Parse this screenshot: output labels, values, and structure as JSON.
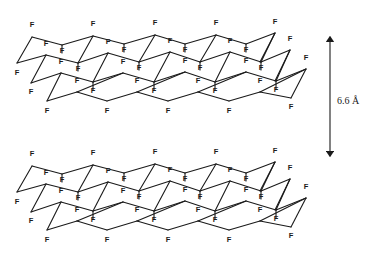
{
  "figure": {
    "atom_label": "F",
    "ink_color": "#1a1a1a",
    "background": "#ffffff"
  },
  "spacing": {
    "label": "6.6 Å",
    "arrow": {
      "x": 330,
      "y_top": 35,
      "y_bottom": 158
    }
  },
  "layers": [
    {
      "name": "top-layer",
      "dy": 0
    },
    {
      "name": "bottom-layer",
      "dy": 129
    }
  ],
  "lattice": {
    "rows": [
      [
        [
          32,
          37
        ],
        [
          62,
          45
        ],
        [
          93,
          36
        ],
        [
          124,
          44
        ],
        [
          155,
          35
        ],
        [
          185,
          44
        ],
        [
          216,
          35
        ],
        [
          246,
          44
        ],
        [
          275,
          33
        ]
      ],
      [
        [
          46,
          55
        ],
        [
          78,
          63
        ],
        [
          108,
          53
        ],
        [
          139,
          62
        ],
        [
          170,
          52
        ],
        [
          200,
          62
        ],
        [
          230,
          52
        ],
        [
          261,
          62
        ],
        [
          290,
          50
        ]
      ],
      [
        [
          61,
          73
        ],
        [
          93,
          82
        ],
        [
          123,
          73
        ],
        [
          154,
          82
        ],
        [
          185,
          72
        ],
        [
          215,
          82
        ],
        [
          246,
          72
        ],
        [
          276,
          81
        ],
        [
          306,
          69
        ]
      ],
      [
        [
          47,
          101
        ],
        [
          77,
          92
        ],
        [
          107,
          101
        ],
        [
          137,
          92
        ],
        [
          168,
          101
        ],
        [
          198,
          92
        ],
        [
          229,
          101
        ],
        [
          260,
          92
        ],
        [
          291,
          98
        ]
      ]
    ],
    "left_nodes": [
      [
        17,
        63
      ],
      [
        31,
        83
      ]
    ],
    "f_labels_up": [
      [
        32,
        27
      ],
      [
        93,
        26
      ],
      [
        155,
        25
      ],
      [
        216,
        25
      ],
      [
        275,
        24
      ],
      [
        46,
        46
      ],
      [
        108,
        44
      ],
      [
        170,
        43
      ],
      [
        230,
        43
      ],
      [
        290,
        41
      ],
      [
        61,
        64
      ],
      [
        123,
        64
      ],
      [
        185,
        63
      ],
      [
        246,
        63
      ],
      [
        306,
        60
      ],
      [
        77,
        83
      ],
      [
        137,
        83
      ],
      [
        198,
        83
      ],
      [
        260,
        83
      ],
      [
        62,
        53
      ],
      [
        124,
        52
      ],
      [
        185,
        52
      ],
      [
        246,
        52
      ],
      [
        78,
        71
      ],
      [
        139,
        70
      ],
      [
        200,
        70
      ],
      [
        261,
        70
      ]
    ],
    "f_labels_down": [
      [
        17,
        75
      ],
      [
        31,
        94
      ],
      [
        47,
        113
      ],
      [
        107,
        113
      ],
      [
        168,
        113
      ],
      [
        229,
        113
      ],
      [
        291,
        109
      ],
      [
        93,
        93
      ],
      [
        154,
        93
      ],
      [
        215,
        93
      ],
      [
        276,
        92
      ]
    ]
  }
}
